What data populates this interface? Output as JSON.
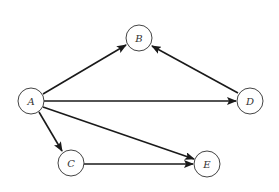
{
  "diagram": {
    "type": "directed-graph",
    "colors": {
      "node_stroke": "#444444",
      "edge_stroke": "#1a1a1a",
      "label": "#333333",
      "background": "#ffffff"
    },
    "nodes": [
      {
        "id": "A",
        "label": "A",
        "cx": 31,
        "cy": 101,
        "r": 13
      },
      {
        "id": "B",
        "label": "B",
        "cx": 139,
        "cy": 38,
        "r": 13
      },
      {
        "id": "D",
        "label": "D",
        "cx": 250,
        "cy": 101,
        "r": 13
      },
      {
        "id": "C",
        "label": "C",
        "cx": 71,
        "cy": 163,
        "r": 13
      },
      {
        "id": "E",
        "label": "E",
        "cx": 207,
        "cy": 164,
        "r": 13
      }
    ],
    "edges": [
      {
        "from": "A",
        "to": "B"
      },
      {
        "from": "A",
        "to": "D"
      },
      {
        "from": "A",
        "to": "C"
      },
      {
        "from": "A",
        "to": "E"
      },
      {
        "from": "D",
        "to": "B"
      },
      {
        "from": "C",
        "to": "E"
      }
    ]
  }
}
